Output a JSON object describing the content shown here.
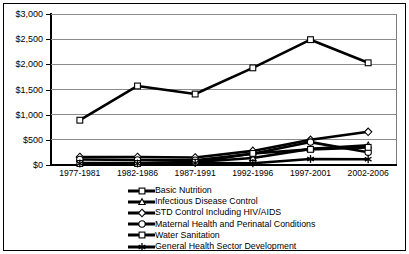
{
  "chart_data": {
    "type": "line",
    "title": "",
    "xlabel": "",
    "ylabel": "",
    "grid": true,
    "legend_position": "bottom",
    "categories": [
      "1977-1981",
      "1982-1986",
      "1987-1991",
      "1992-1996",
      "1997-2001",
      "2002-2006"
    ],
    "ylim": [
      0,
      3000
    ],
    "yticks": [
      0,
      500,
      1000,
      1500,
      2000,
      2500,
      3000
    ],
    "ytick_labels": [
      "$0",
      "$500",
      "$1,000",
      "$1,500",
      "$2,000",
      "$2,500",
      "$3,000"
    ],
    "series": [
      {
        "name": "Basic Nutrition",
        "marker": "square-open",
        "color": "#000000",
        "values": [
          890,
          1570,
          1410,
          1930,
          2490,
          2030
        ]
      },
      {
        "name": "Infectious Disease Control",
        "marker": "triangle-open",
        "color": "#000000",
        "values": [
          40,
          40,
          60,
          140,
          320,
          390
        ]
      },
      {
        "name": "STD Control Including HIV/AIDS",
        "marker": "diamond-open",
        "color": "#000000",
        "values": [
          160,
          160,
          150,
          280,
          500,
          660
        ]
      },
      {
        "name": "Maternal Health and Perinatal Conditions",
        "marker": "circle-open",
        "color": "#000000",
        "values": [
          110,
          100,
          95,
          225,
          455,
          255
        ]
      },
      {
        "name": "Water Sanitation",
        "marker": "square-open",
        "color": "#000000",
        "values": [
          30,
          30,
          55,
          230,
          310,
          350
        ]
      },
      {
        "name": "General Health Sector Development",
        "marker": "star",
        "color": "#000000",
        "values": [
          30,
          30,
          40,
          35,
          120,
          115
        ]
      }
    ]
  }
}
